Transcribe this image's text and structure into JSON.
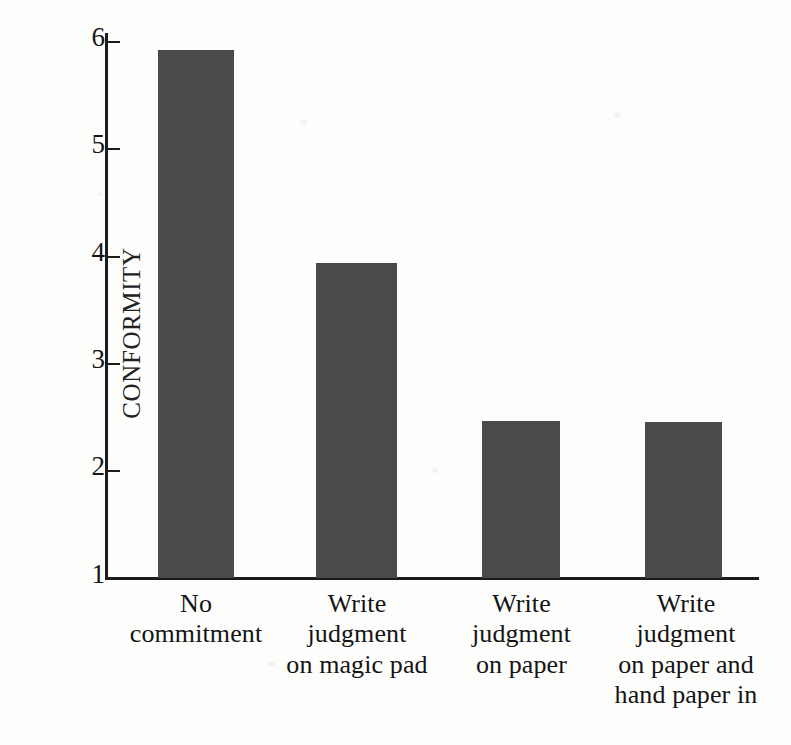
{
  "chart_data": {
    "type": "bar",
    "title": "",
    "xlabel": "",
    "ylabel": "CONFORMITY",
    "ylim": [
      1,
      6
    ],
    "yticks": [
      "1",
      "2",
      "3",
      "4",
      "5",
      "6"
    ],
    "grid": false,
    "legend": null,
    "bar_color": "#4a4a4a",
    "background_color": "#fdfdfc",
    "axis_color": "#1d1d1d",
    "categories": [
      "No\ncommitment",
      "Write\njudgment\non magic pad",
      "Write\njudgment\non paper",
      "Write\njudgment\non paper and\nhand paper in"
    ],
    "values": [
      5.92,
      3.93,
      2.46,
      2.45
    ]
  },
  "axis": {
    "y_title": "CONFORMITY"
  }
}
